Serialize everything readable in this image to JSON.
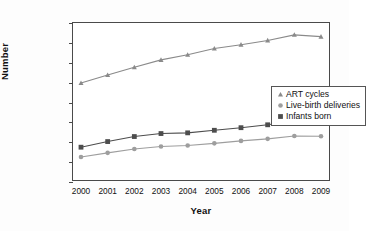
{
  "chart_data": {
    "type": "line",
    "title": "",
    "xlabel": "Year",
    "ylabel": "Number",
    "categories": [
      "2000",
      "2001",
      "2002",
      "2003",
      "2004",
      "2005",
      "2006",
      "2007",
      "2008",
      "2009"
    ],
    "x": [
      2000,
      2001,
      2002,
      2003,
      2004,
      2005,
      2006,
      2007,
      2008,
      2009
    ],
    "ylim": [
      0,
      160000
    ],
    "xlim": [
      2000,
      2009
    ],
    "y_ticks": [
      0,
      20000,
      40000,
      60000,
      80000,
      100000,
      120000,
      140000,
      160000
    ],
    "y_tick_labels": [
      "0",
      "20,000",
      "40,000",
      "60,000",
      "80,000",
      "100,000",
      "120,000",
      "140,000",
      "160,000"
    ],
    "grid": false,
    "legend_position": "center-right",
    "series": [
      {
        "name": "ART cycles",
        "marker": "triangle",
        "color": "#8a8a8a",
        "values": [
          99629,
          107587,
          115392,
          122872,
          127977,
          134260,
          138198,
          142435,
          148055,
          146244
        ]
      },
      {
        "name": "Live-birth deliveries",
        "marker": "circle",
        "color": "#9e9e9e",
        "values": [
          25228,
          29344,
          33141,
          35785,
          36760,
          38910,
          41343,
          43412,
          46326,
          46087
        ]
      },
      {
        "name": "Infants born",
        "marker": "square",
        "color": "#4d4d4d",
        "values": [
          35025,
          40687,
          45751,
          48756,
          49458,
          52041,
          54656,
          57569,
          61426,
          60190
        ]
      }
    ]
  },
  "legend": {
    "entries": [
      {
        "label": "ART cycles",
        "marker": "triangle-marker"
      },
      {
        "label": "Live-birth deliveries",
        "marker": "circle-marker"
      },
      {
        "label": "Infants born",
        "marker": "square-marker"
      }
    ]
  },
  "axes": {
    "y_title": "Number",
    "x_title": "Year"
  }
}
